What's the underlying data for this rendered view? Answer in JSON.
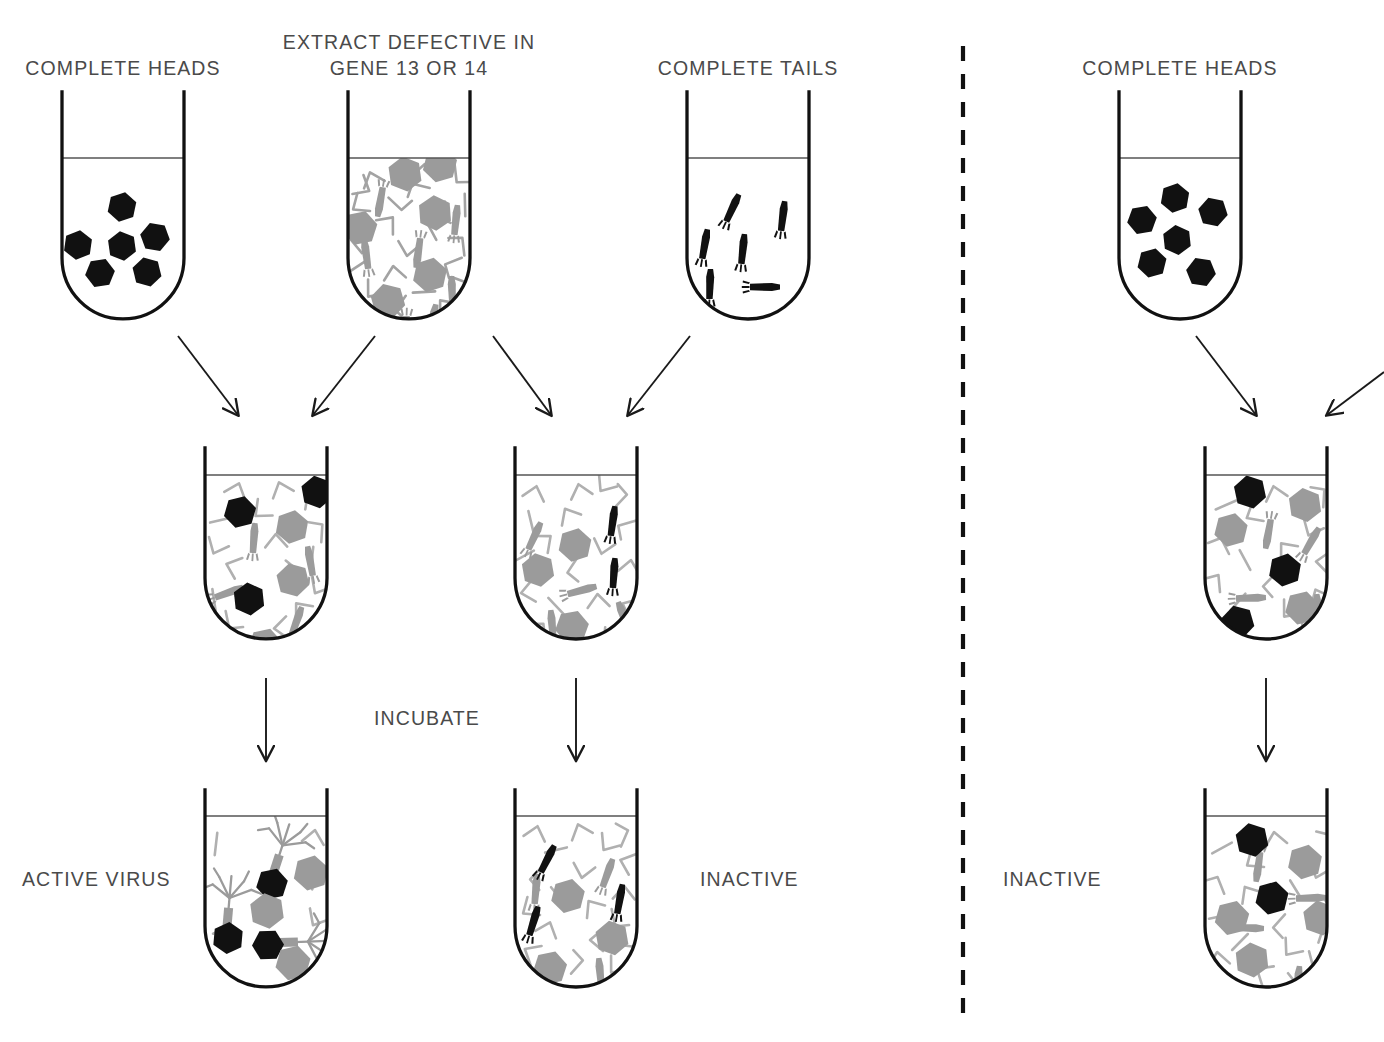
{
  "figure": {
    "title_labels": {
      "complete_heads_left": "COMPLETE HEADS",
      "extract_defective_l1": "EXTRACT DEFECTIVE IN",
      "extract_defective_l2": "GENE 13 OR 14",
      "complete_tails": "COMPLETE TAILS",
      "complete_heads_right": "COMPLETE HEADS"
    },
    "process_labels": {
      "incubate": "INCUBATE"
    },
    "result_labels": {
      "active_virus": "ACTIVE VIRUS",
      "inactive_middle": "INACTIVE",
      "inactive_right": "INACTIVE"
    },
    "colors": {
      "outline": "#111111",
      "gray_particle": "#9b9b9b",
      "black_particle": "#111111",
      "text": "#4a4a4a",
      "divider": "#111111",
      "liquid_line": "#444444"
    },
    "divider": {
      "style": "dashed-vertical",
      "x": 963
    },
    "tubes": [
      {
        "id": "tube-complete-heads-left",
        "label": "COMPLETE HEADS",
        "row": "top",
        "contents": {
          "black_heads": 6,
          "gray_heads": 0,
          "black_tails": 0,
          "gray_tails": 0,
          "gray_fragments": 0,
          "assembled_phage": 0
        }
      },
      {
        "id": "tube-extract-defective",
        "label": "EXTRACT DEFECTIVE IN GENE 13 OR 14",
        "row": "top",
        "contents": {
          "black_heads": 0,
          "gray_heads": 6,
          "black_tails": 0,
          "gray_tails": 7,
          "gray_fragments": 26,
          "assembled_phage": 0
        }
      },
      {
        "id": "tube-complete-tails",
        "label": "COMPLETE TAILS",
        "row": "top",
        "contents": {
          "black_heads": 0,
          "gray_heads": 0,
          "black_tails": 6,
          "gray_tails": 0,
          "gray_fragments": 0,
          "assembled_phage": 0
        }
      },
      {
        "id": "tube-complete-heads-right",
        "label": "COMPLETE HEADS",
        "row": "top",
        "panel": "right",
        "contents": {
          "black_heads": 6,
          "gray_heads": 0,
          "black_tails": 0,
          "gray_tails": 0,
          "gray_fragments": 0,
          "assembled_phage": 0
        }
      },
      {
        "id": "tube-mix-heads-extract",
        "row": "middle",
        "contents": {
          "black_heads": 3,
          "gray_heads": 3,
          "black_tails": 0,
          "gray_tails": 4,
          "gray_fragments": 18,
          "assembled_phage": 0
        }
      },
      {
        "id": "tube-mix-tails-extract",
        "row": "middle",
        "contents": {
          "black_heads": 0,
          "gray_heads": 3,
          "black_tails": 3,
          "gray_tails": 4,
          "gray_fragments": 18,
          "assembled_phage": 0
        }
      },
      {
        "id": "tube-mix-heads-extract-right",
        "row": "middle",
        "panel": "right",
        "contents": {
          "black_heads": 3,
          "gray_heads": 3,
          "black_tails": 0,
          "gray_tails": 4,
          "gray_fragments": 17,
          "assembled_phage": 0
        }
      },
      {
        "id": "tube-result-active-virus",
        "row": "bottom",
        "label": "ACTIVE VIRUS",
        "contents": {
          "black_heads": 0,
          "gray_heads": 3,
          "black_tails": 0,
          "gray_tails": 0,
          "gray_fragments": 5,
          "assembled_phage": 3
        }
      },
      {
        "id": "tube-result-inactive-middle",
        "row": "bottom",
        "label": "INACTIVE",
        "contents": {
          "black_heads": 0,
          "gray_heads": 3,
          "black_tails": 3,
          "gray_tails": 3,
          "gray_fragments": 20,
          "assembled_phage": 0
        }
      },
      {
        "id": "tube-result-inactive-right",
        "row": "bottom",
        "panel": "right",
        "label": "INACTIVE",
        "contents": {
          "black_heads": 2,
          "gray_heads": 4,
          "black_tails": 0,
          "gray_tails": 4,
          "gray_fragments": 18,
          "assembled_phage": 0
        }
      }
    ],
    "arrows": [
      {
        "id": "arrow-heads-to-mix1",
        "from": "tube-complete-heads-left",
        "to": "tube-mix-heads-extract",
        "direction": "down-right"
      },
      {
        "id": "arrow-extract-to-mix1",
        "from": "tube-extract-defective",
        "to": "tube-mix-heads-extract",
        "direction": "down-left"
      },
      {
        "id": "arrow-extract-to-mix2",
        "from": "tube-extract-defective",
        "to": "tube-mix-tails-extract",
        "direction": "down-right"
      },
      {
        "id": "arrow-tails-to-mix2",
        "from": "tube-complete-tails",
        "to": "tube-mix-tails-extract",
        "direction": "down-left"
      },
      {
        "id": "arrow-mix1-to-result1",
        "from": "tube-mix-heads-extract",
        "to": "tube-result-active-virus",
        "direction": "down"
      },
      {
        "id": "arrow-mix2-to-result2",
        "from": "tube-mix-tails-extract",
        "to": "tube-result-inactive-middle",
        "direction": "down"
      },
      {
        "id": "arrow-heads-right-to-mix3",
        "from": "tube-complete-heads-right",
        "to": "tube-mix-heads-extract-right",
        "direction": "down-right"
      },
      {
        "id": "arrow-offscreen-to-mix3",
        "from": "offscreen-right",
        "to": "tube-mix-heads-extract-right",
        "direction": "down-left"
      },
      {
        "id": "arrow-mix3-to-result3",
        "from": "tube-mix-heads-extract-right",
        "to": "tube-result-inactive-right",
        "direction": "down"
      }
    ]
  }
}
